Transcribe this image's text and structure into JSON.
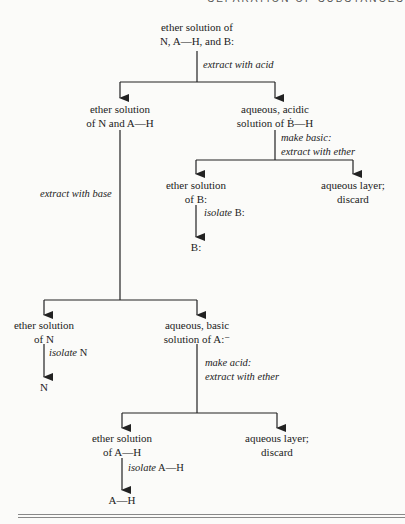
{
  "header": {
    "running_title": "SEPARATION OF SUBSTANCES"
  },
  "nodes": {
    "start": {
      "line1": "ether solution of",
      "line2": "N, A—H, and B:"
    },
    "ether_N_AH": {
      "line1": "ether solution",
      "line2": "of N and A—H"
    },
    "aq_acidic_BH": {
      "line1": "aqueous, acidic",
      "line2": "solution of Ḃ—H"
    },
    "ether_B": {
      "line1": "ether solution",
      "line2": "of B:"
    },
    "aq_layer_1": {
      "line1": "aqueous layer;",
      "line2": "discard"
    },
    "product_B": {
      "line1": "B:"
    },
    "ether_N": {
      "line1": "ether solution",
      "line2": "of N"
    },
    "aq_basic_A": {
      "line1": "aqueous, basic",
      "line2": "solution of A:⁻"
    },
    "product_N": {
      "line1": "N"
    },
    "ether_AH": {
      "line1": "ether solution",
      "line2": "of A—H"
    },
    "aq_layer_2": {
      "line1": "aqueous layer;",
      "line2": "discard"
    },
    "product_AH": {
      "line1": "A—H"
    }
  },
  "steps": {
    "extract_acid": {
      "line1": "extract with acid"
    },
    "make_basic": {
      "line1": "make basic:",
      "line2": "extract with ether"
    },
    "isolate_B": {
      "italic": "isolate",
      "upright": " B:"
    },
    "extract_base": {
      "line1": "extract with base"
    },
    "isolate_N": {
      "italic": "isolate",
      "upright": " N"
    },
    "make_acid": {
      "line1": "make acid:",
      "line2": "extract with ether"
    },
    "isolate_AH": {
      "italic": "isolate",
      "upright": " A—H"
    }
  },
  "colors": {
    "line": "#222222",
    "background": "#fbfbf9",
    "rule": "#888888"
  }
}
